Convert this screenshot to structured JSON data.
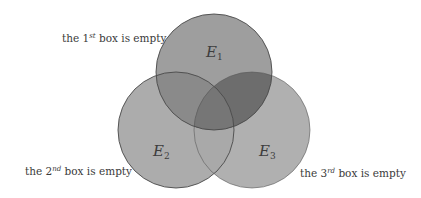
{
  "diagram": {
    "type": "venn",
    "sets": [
      {
        "id": "E1",
        "name": "E",
        "subscript": "1",
        "cx": 214,
        "cy": 72,
        "r": 58
      },
      {
        "id": "E2",
        "name": "E",
        "subscript": "2",
        "cx": 176,
        "cy": 130,
        "r": 58
      },
      {
        "id": "E3",
        "name": "E",
        "subscript": "3",
        "cx": 252,
        "cy": 130,
        "r": 58
      }
    ],
    "colors": {
      "background": "#ffffff",
      "e1_only": "#9e9e9e",
      "e2_only": "#acacac",
      "e3_only": "#b0b0b0",
      "e2_e3": "#a9a9a9",
      "e1_e2": "#8a8a8a",
      "e1_e3": "#6d6d6d",
      "e1_e2_e3": "#767676",
      "outline": "#4a4a4a"
    },
    "labels": [
      {
        "prefix": "the ",
        "ordinal": "1",
        "suffix_sup": "st",
        "rest": " box is empty"
      },
      {
        "prefix": "the ",
        "ordinal": "2",
        "suffix_sup": "nd",
        "rest": " box is empty"
      },
      {
        "prefix": "the ",
        "ordinal": "3",
        "suffix_sup": "rd",
        "rest": " box is empty"
      }
    ]
  }
}
